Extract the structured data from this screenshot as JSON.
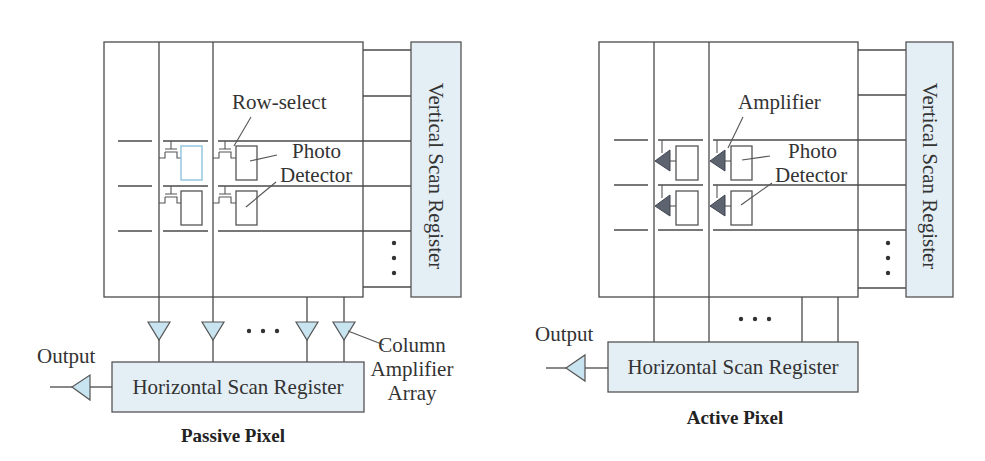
{
  "colors": {
    "register_fill": "#e3eef5",
    "amplifier_fill": "#c8e4f0",
    "pixel_amplifier_fill": "#5d6470",
    "highlight_stroke": "#8fc3e0",
    "line": "#4a4a4a"
  },
  "passive": {
    "caption": "Passive Pixel",
    "vertical_register": "Vertical Scan Register",
    "horizontal_register": "Horizontal Scan Register",
    "output_label": "Output",
    "row_select_label": "Row-select",
    "photo_label": "Photo",
    "detector_label": "Detector",
    "column_amp_label_1": "Column",
    "column_amp_label_2": "Amplifier",
    "column_amp_label_3": "Array",
    "ellipsis": "• • •"
  },
  "active": {
    "caption": "Active Pixel",
    "vertical_register": "Vertical Scan Register",
    "horizontal_register": "Horizontal Scan Register",
    "output_label": "Output",
    "amplifier_label": "Amplifier",
    "photo_label": "Photo",
    "detector_label": "Detector",
    "ellipsis": "• • •"
  }
}
